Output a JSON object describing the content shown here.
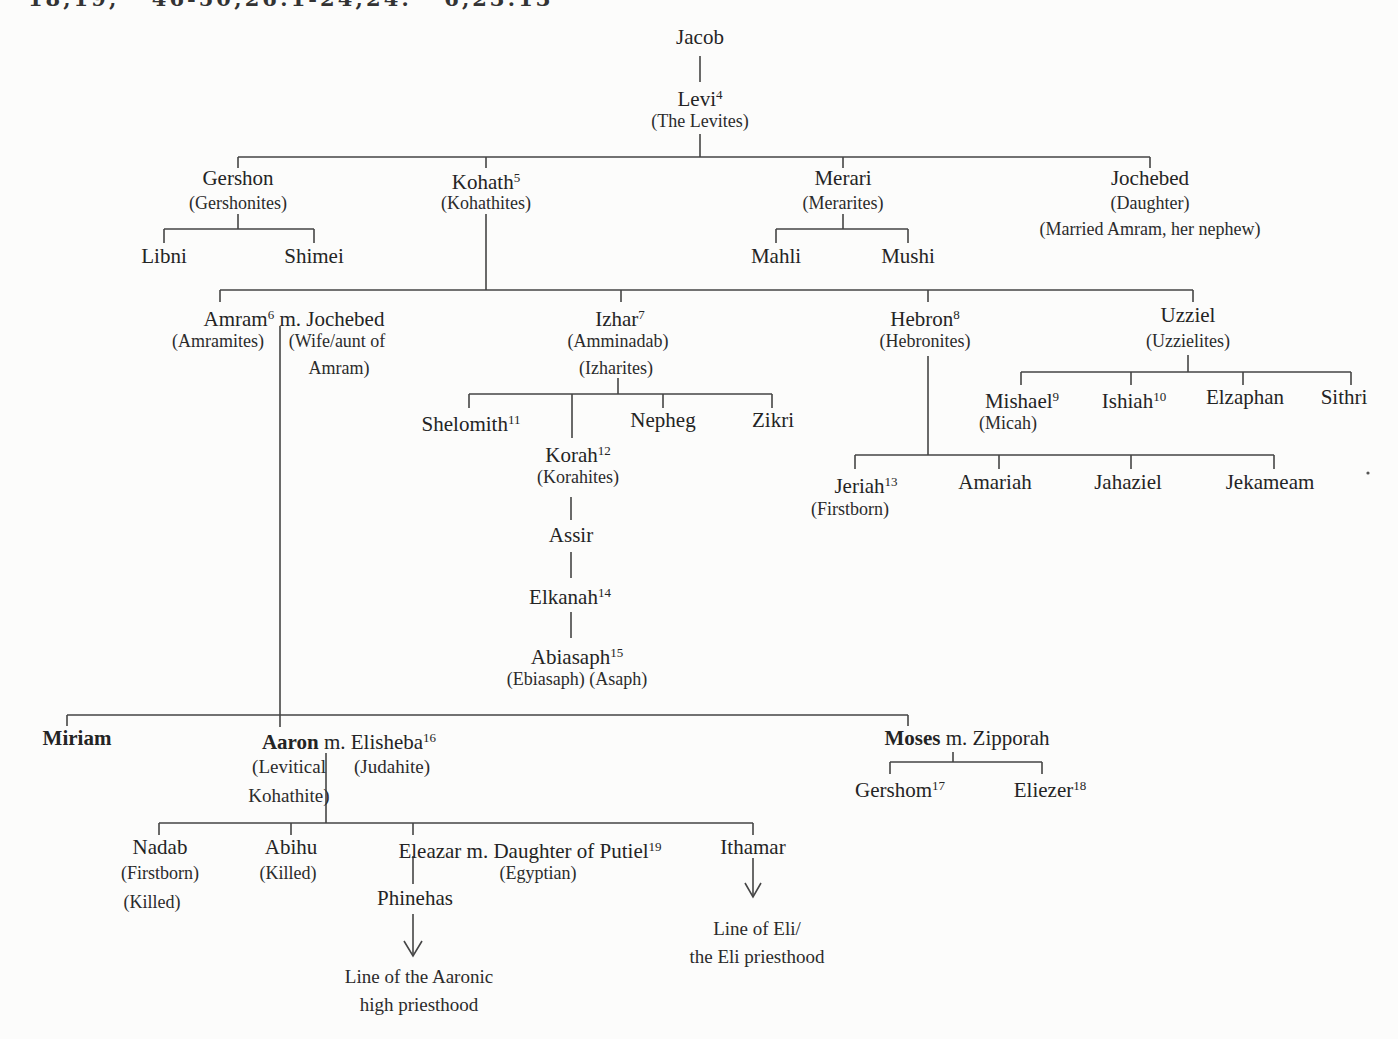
{
  "header": {
    "partially_cut_text": "18,19; 46-50;26:1-24;24: 6,23:13"
  },
  "tree": {
    "jacob": {
      "name": "Jacob"
    },
    "levi": {
      "name": "Levi",
      "sup": "4",
      "sub1": "(The Levites)"
    },
    "gershon": {
      "name": "Gershon",
      "sub1": "(Gershonites)"
    },
    "kohath": {
      "name": "Kohath",
      "sup": "5",
      "sub1": "(Kohathites)"
    },
    "merari": {
      "name": "Merari",
      "sub1": "(Merarites)"
    },
    "jochebed": {
      "name": "Jochebed",
      "sub1": "(Daughter)",
      "sub2": "(Married Amram, her nephew)"
    },
    "libni": {
      "name": "Libni"
    },
    "shimei": {
      "name": "Shimei"
    },
    "mahli": {
      "name": "Mahli"
    },
    "mushi": {
      "name": "Mushi"
    },
    "amram": {
      "name": "Amram",
      "sup": "6",
      "spouse": " m. Jochebed",
      "sub1": "(Amramites)",
      "sub2": "(Wife/aunt of",
      "sub3": "Amram)"
    },
    "izhar": {
      "name": "Izhar",
      "sup": "7",
      "sub1": "(Amminadab)",
      "sub2": "(Izharites)"
    },
    "hebron": {
      "name": "Hebron",
      "sup": "8",
      "sub1": "(Hebronites)"
    },
    "uzziel": {
      "name": "Uzziel",
      "sub1": "(Uzzielites)"
    },
    "shelomith": {
      "name": "Shelomith",
      "sup": "11"
    },
    "korah": {
      "name": "Korah",
      "sup": "12",
      "sub1": "(Korahites)"
    },
    "nepheg": {
      "name": "Nepheg"
    },
    "zikri": {
      "name": "Zikri"
    },
    "assir": {
      "name": "Assir"
    },
    "elkanah": {
      "name": "Elkanah",
      "sup": "14"
    },
    "abiasaph": {
      "name": "Abiasaph",
      "sup": "15",
      "sub1": "(Ebiasaph) (Asaph)"
    },
    "mishael": {
      "name": "Mishael",
      "sup": "9",
      "sub1": "(Micah)"
    },
    "ishiah": {
      "name": "Ishiah",
      "sup": "10"
    },
    "elzaphan": {
      "name": "Elzaphan"
    },
    "sithri": {
      "name": "Sithri"
    },
    "jeriah": {
      "name": "Jeriah",
      "sup": "13",
      "sub1": "(Firstborn)"
    },
    "amariah": {
      "name": "Amariah"
    },
    "jahaziel": {
      "name": "Jahaziel"
    },
    "jekameam": {
      "name": "Jekameam"
    },
    "miriam": {
      "name": "Miriam"
    },
    "aaron": {
      "name": "Aaron",
      "spouse": " m. Elisheba",
      "sup": "16",
      "sub1": "(Levitical",
      "sub2": "(Judahite)",
      "sub3": "Kohathite)"
    },
    "moses": {
      "name": "Moses",
      "spouse": " m. Zipporah"
    },
    "gershom": {
      "name": "Gershom",
      "sup": "17"
    },
    "eliezer": {
      "name": "Eliezer",
      "sup": "18"
    },
    "nadab": {
      "name": "Nadab",
      "sub1": "(Firstborn)",
      "sub2": "(Killed)"
    },
    "abihu": {
      "name": "Abihu",
      "sub1": "(Killed)"
    },
    "eleazar": {
      "name": "Eleazar",
      "spouse": " m. Daughter of Putiel",
      "sup": "19",
      "sub1": "(Egyptian)"
    },
    "ithamar": {
      "name": "Ithamar"
    },
    "phinehas": {
      "name": "Phinehas"
    },
    "aaronic_note": {
      "line1": "Line of the Aaronic",
      "line2": "high priesthood"
    },
    "eli_note": {
      "line1": "Line of Eli/",
      "line2": "the Eli priesthood"
    }
  }
}
